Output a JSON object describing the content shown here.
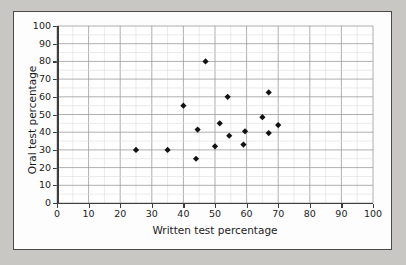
{
  "chart_data": {
    "type": "scatter",
    "title": "",
    "xlabel": "Written test percentage",
    "ylabel": "Oral test percentage",
    "xlim": [
      0,
      100
    ],
    "ylim": [
      0,
      100
    ],
    "xticks": [
      0,
      10,
      20,
      30,
      40,
      50,
      60,
      70,
      80,
      90,
      100
    ],
    "yticks": [
      0,
      10,
      20,
      30,
      40,
      50,
      60,
      70,
      80,
      90,
      100
    ],
    "x_major_step": 10,
    "y_major_step": 10,
    "minor_step": 5,
    "grid": "major and minor gridlines on both axes",
    "legend": "none",
    "marker": "filled black diamond",
    "marker_color": "#121212",
    "n_points": 16,
    "points": [
      {
        "x": 25,
        "y": 30
      },
      {
        "x": 35,
        "y": 30
      },
      {
        "x": 40,
        "y": 55
      },
      {
        "x": 44,
        "y": 25
      },
      {
        "x": 44.5,
        "y": 41.5
      },
      {
        "x": 47,
        "y": 80
      },
      {
        "x": 50,
        "y": 32
      },
      {
        "x": 51.5,
        "y": 45
      },
      {
        "x": 54,
        "y": 60
      },
      {
        "x": 54.5,
        "y": 38
      },
      {
        "x": 59,
        "y": 33
      },
      {
        "x": 59.5,
        "y": 40.5
      },
      {
        "x": 65,
        "y": 48.5
      },
      {
        "x": 67,
        "y": 62.5
      },
      {
        "x": 67,
        "y": 39.5
      },
      {
        "x": 70,
        "y": 44
      }
    ]
  },
  "colors": {
    "page_background": "#c9c7c3",
    "card_background": "#fdfdfd",
    "card_border": "#4a4a4a",
    "plot_background": "#ffffff",
    "axis": "#3d3d3d",
    "gridline_major": "#9a9a9a",
    "gridline_minor": "#dcdcdc",
    "marker": "#121212",
    "text": "#1c1c1c"
  }
}
